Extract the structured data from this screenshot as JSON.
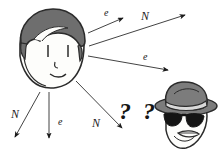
{
  "figure": {
    "background_color": "#ffffff",
    "ink_color": "#1a1a1a"
  },
  "characters": {
    "sender": {
      "name": "cartoon-face",
      "hair_color": "#6e6e6e",
      "hair_outline_color": "#2b2b2b",
      "skin_color": "#fdfdfb",
      "outline_color": "#2b2b2b"
    },
    "eavesdropper": {
      "name": "detective-face",
      "hat_color": "#7c7c7c",
      "hat_band_color": "#d8d8d8",
      "hat_outline_color": "#2b2b2b",
      "glasses_color": "#141414",
      "skin_color": "#fdfdfb",
      "outline_color": "#2b2b2b"
    }
  },
  "arrows": [
    {
      "id": "arrow-up-e",
      "label": "e",
      "label_kind": "e",
      "x1": 88,
      "y1": 33,
      "x2": 123,
      "y2": 18,
      "label_x": 104,
      "label_y": 8
    },
    {
      "id": "arrow-up-n",
      "label": "N",
      "label_kind": "N",
      "x1": 89,
      "y1": 46,
      "x2": 185,
      "y2": 15,
      "label_x": 141,
      "label_y": 10
    },
    {
      "id": "arrow-right-e",
      "label": "e",
      "label_kind": "e",
      "x1": 88,
      "y1": 56,
      "x2": 168,
      "y2": 70,
      "label_x": 143,
      "label_y": 52
    },
    {
      "id": "arrow-downleft-n",
      "label": "N",
      "label_kind": "N",
      "x1": 40,
      "y1": 92,
      "x2": 15,
      "y2": 137,
      "label_x": 11,
      "label_y": 108
    },
    {
      "id": "arrow-down-e",
      "label": "e",
      "label_kind": "e",
      "x1": 49,
      "y1": 92,
      "x2": 49,
      "y2": 138,
      "label_x": 58,
      "label_y": 117
    },
    {
      "id": "arrow-downright-n",
      "label": "N",
      "label_kind": "N",
      "x1": 76,
      "y1": 81,
      "x2": 122,
      "y2": 128,
      "label_x": 92,
      "label_y": 117
    }
  ],
  "annotations": {
    "question_marks": {
      "text": "? ?",
      "x": 119,
      "y": 99,
      "font_size": 24
    }
  }
}
